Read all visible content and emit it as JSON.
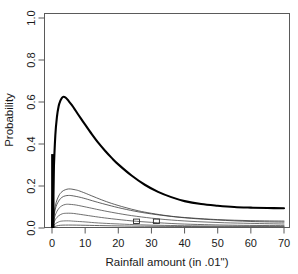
{
  "chart_data": {
    "type": "line",
    "title": "",
    "xlabel": "Rainfall amount (in .01\")",
    "ylabel": "Probability",
    "xlim": [
      0,
      72
    ],
    "ylim": [
      0,
      1.0
    ],
    "xticks": [
      0,
      10,
      20,
      30,
      40,
      50,
      60,
      70
    ],
    "xticklabels": [
      "0",
      "10",
      "20",
      "30",
      "40",
      "50",
      "60",
      "70"
    ],
    "yticks": [
      0.0,
      0.2,
      0.4,
      0.6,
      0.8,
      1.0
    ],
    "yticklabels": [
      "0.0",
      "0.2",
      "0.4",
      "0.6",
      "0.8",
      "1.0"
    ],
    "grid": false,
    "legend": "none",
    "box": "full",
    "series": [
      {
        "name": "curve-1-thick",
        "style": "thick",
        "linewidth": 2.1,
        "color": "#000000",
        "x": [
          0,
          0.5,
          1,
          1.5,
          2,
          2.5,
          3,
          3.5,
          4,
          4.5,
          5,
          6,
          7,
          8,
          9,
          10,
          12,
          14,
          16,
          18,
          20,
          24,
          28,
          32,
          36,
          40,
          45,
          50,
          55,
          60,
          65,
          70
        ],
        "values": [
          0.005,
          0.26,
          0.44,
          0.53,
          0.58,
          0.605,
          0.62,
          0.625,
          0.622,
          0.615,
          0.605,
          0.585,
          0.562,
          0.538,
          0.515,
          0.492,
          0.447,
          0.405,
          0.368,
          0.334,
          0.303,
          0.25,
          0.206,
          0.172,
          0.147,
          0.128,
          0.114,
          0.106,
          0.1,
          0.097,
          0.095,
          0.094
        ]
      },
      {
        "name": "curve-2",
        "style": "thin",
        "linewidth": 0.8,
        "color": "#3a3a3a",
        "x": [
          0,
          1,
          2,
          3,
          4,
          5,
          6,
          7,
          8,
          10,
          12,
          15,
          18,
          22,
          26,
          30,
          35,
          40,
          50,
          60,
          70
        ],
        "values": [
          0.004,
          0.105,
          0.152,
          0.173,
          0.182,
          0.186,
          0.185,
          0.182,
          0.178,
          0.166,
          0.153,
          0.134,
          0.117,
          0.098,
          0.082,
          0.07,
          0.058,
          0.05,
          0.04,
          0.035,
          0.033
        ]
      },
      {
        "name": "curve-3",
        "style": "thin",
        "linewidth": 0.8,
        "color": "#3a3a3a",
        "x": [
          0,
          1,
          2,
          3,
          4,
          5,
          6,
          8,
          10,
          13,
          16,
          20,
          25,
          30,
          36,
          42,
          50,
          60,
          70
        ],
        "values": [
          0.004,
          0.09,
          0.128,
          0.146,
          0.153,
          0.155,
          0.154,
          0.148,
          0.14,
          0.126,
          0.113,
          0.097,
          0.08,
          0.067,
          0.055,
          0.046,
          0.038,
          0.031,
          0.028
        ]
      },
      {
        "name": "curve-4",
        "style": "thin",
        "linewidth": 0.8,
        "color": "#4a4a4a",
        "x": [
          0,
          1,
          2,
          3,
          4,
          5,
          7,
          9,
          12,
          15,
          19,
          24,
          30,
          36,
          44,
          52,
          60,
          70
        ],
        "values": [
          0.003,
          0.062,
          0.092,
          0.106,
          0.112,
          0.113,
          0.11,
          0.104,
          0.094,
          0.084,
          0.072,
          0.059,
          0.047,
          0.038,
          0.03,
          0.025,
          0.022,
          0.019
        ]
      },
      {
        "name": "curve-5",
        "style": "thin",
        "linewidth": 0.8,
        "color": "#4a4a4a",
        "x": [
          0,
          1,
          2,
          3,
          4,
          6,
          8,
          11,
          14,
          18,
          24,
          30,
          38,
          46,
          56,
          70
        ],
        "values": [
          0.003,
          0.04,
          0.058,
          0.067,
          0.07,
          0.07,
          0.066,
          0.059,
          0.052,
          0.044,
          0.034,
          0.027,
          0.02,
          0.016,
          0.013,
          0.011
        ]
      },
      {
        "name": "curve-6",
        "style": "thin",
        "linewidth": 0.8,
        "color": "#555555",
        "x": [
          0,
          1,
          2,
          3,
          5,
          7,
          10,
          14,
          19,
          25,
          32,
          40,
          50,
          60,
          70
        ],
        "values": [
          0.002,
          0.02,
          0.029,
          0.033,
          0.034,
          0.032,
          0.029,
          0.024,
          0.02,
          0.016,
          0.013,
          0.011,
          0.009,
          0.008,
          0.008
        ]
      },
      {
        "name": "curve-7-baseline",
        "style": "thin",
        "linewidth": 0.9,
        "color": "#555555",
        "x": [
          0,
          2,
          5,
          10,
          16,
          24,
          32,
          42,
          52,
          62,
          70
        ],
        "values": [
          0.002,
          0.012,
          0.014,
          0.013,
          0.011,
          0.009,
          0.008,
          0.007,
          0.006,
          0.006,
          0.006
        ]
      }
    ],
    "annotations": [
      {
        "name": "zero-spike",
        "type": "vertical-bar",
        "x": 0.25,
        "y0": 0.0,
        "y1": 0.352,
        "linewidth": 3.4,
        "color": "#000000"
      },
      {
        "name": "overlap-mark-a",
        "type": "marker",
        "x": 25.5,
        "y": 0.032
      },
      {
        "name": "overlap-mark-b",
        "type": "marker",
        "x": 31.5,
        "y": 0.032
      }
    ]
  },
  "axes": {
    "y_label": "Probability",
    "x_label": "Rainfall amount (in .01\")"
  }
}
